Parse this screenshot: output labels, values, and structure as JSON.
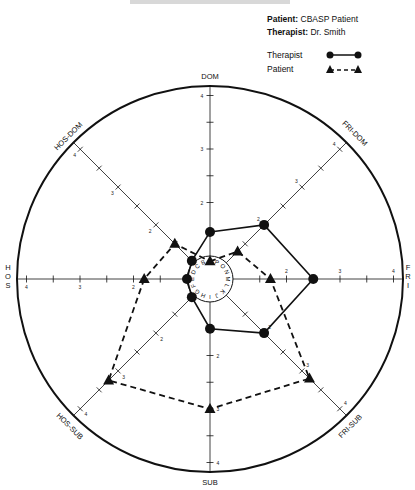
{
  "header": {
    "patient_label": "Patient:",
    "patient_value": "CBASP Patient",
    "therapist_label": "Therapist:",
    "therapist_value": "Dr. Smith"
  },
  "legend": [
    {
      "label": "Therapist",
      "marker": "circle",
      "line": "solid"
    },
    {
      "label": "Patient",
      "marker": "triangle",
      "line": "dashed"
    }
  ],
  "axes": {
    "top": "DOM",
    "bottom": "SUB",
    "left": "HOS",
    "right": "FRI",
    "top_left": "HOS-DOM",
    "top_right": "FRI-DOM",
    "bottom_left": "HOS-SUB",
    "bottom_right": "FRI-SUB"
  },
  "inner_ring_letters": [
    "A",
    "P",
    "O",
    "N",
    "M",
    "L",
    "K",
    "J",
    "I",
    "H",
    "G",
    "F",
    "E",
    "D",
    "C",
    "B"
  ],
  "colors": {
    "line": "#111111",
    "background": "#ffffff"
  },
  "chart_data": {
    "type": "radar",
    "title": "",
    "categories": [
      "DOM",
      "FRI-DOM",
      "FRI",
      "FRI-SUB",
      "SUB",
      "HOS-SUB",
      "HOS",
      "HOS-DOM"
    ],
    "axis_ticks": [
      1,
      2,
      3,
      4
    ],
    "tick_labels_shown": [
      "2",
      "3",
      "4"
    ],
    "ylim": [
      1,
      4
    ],
    "grid": false,
    "legend_position": "top-right",
    "series": [
      {
        "name": "Therapist",
        "marker": "circle",
        "line": "solid",
        "values": [
          1.45,
          2.0,
          2.5,
          2.0,
          1.5,
          1.05,
          1.0,
          1.05
        ]
      },
      {
        "name": "Patient",
        "marker": "triangle",
        "line": "dashed",
        "values": [
          0.9,
          1.3,
          1.7,
          3.2,
          3.0,
          3.25,
          1.8,
          1.5
        ]
      }
    ]
  }
}
